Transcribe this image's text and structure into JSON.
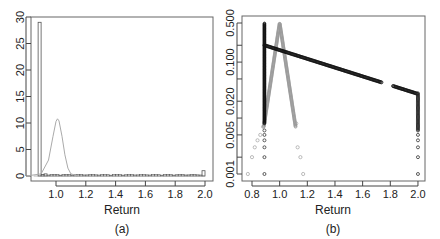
{
  "chart_data": [
    {
      "panel": "(a)",
      "type": "bar",
      "title": "",
      "xlabel": "Return",
      "ylabel": "",
      "caption": "(a)",
      "xlim": [
        0.83,
        2.05
      ],
      "ylim": [
        0,
        30
      ],
      "xticks": [
        "1.0",
        "1.2",
        "1.4",
        "1.6",
        "1.8",
        "2.0"
      ],
      "yticks": [
        "0",
        "5",
        "10",
        "15",
        "20",
        "25",
        "30"
      ],
      "grid": false,
      "legend": null,
      "histogram": {
        "bin_width": 0.02,
        "bins": [
          {
            "x0": 0.88,
            "x1": 0.9,
            "height": 29.0
          },
          {
            "x0": 0.9,
            "x1": 0.92,
            "height": 0.3
          },
          {
            "x0": 0.92,
            "x1": 0.94,
            "height": 0.4
          },
          {
            "x0": 0.94,
            "x1": 1.98,
            "height": 0.2
          },
          {
            "x0": 1.98,
            "x1": 2.0,
            "height": 1.0
          }
        ]
      },
      "density_curve": {
        "color": "#aaaaaa",
        "x": [
          0.8,
          0.9,
          0.95,
          0.98,
          1.0,
          1.01,
          1.02,
          1.04,
          1.06,
          1.08,
          1.1,
          1.15
        ],
        "y": [
          0.0,
          0.4,
          3.0,
          7.5,
          10.3,
          10.8,
          10.4,
          7.5,
          4.0,
          1.5,
          0.4,
          0.0
        ]
      }
    },
    {
      "panel": "(b)",
      "type": "scatter",
      "title": "",
      "xlabel": "Return",
      "ylabel": "",
      "caption": "(b)",
      "xlim": [
        0.75,
        2.03
      ],
      "ylim": [
        0.001,
        0.5
      ],
      "yscale": "log",
      "xticks": [
        "0.8",
        "1.0",
        "1.2",
        "1.4",
        "1.6",
        "1.8",
        "2.0"
      ],
      "yticks": [
        "0.001",
        "0.005",
        "0.020",
        "0.100",
        "0.500"
      ],
      "yticks_minor": [
        "0.002",
        "0.010",
        "0.050",
        "0.200"
      ],
      "grid": false,
      "legend": null,
      "series": [
        {
          "name": "gray-distribution",
          "color": "#999999",
          "marker": "open-circle",
          "description": "Triangular peak centered at 1.0 reaching 0.5, tails down to 0.001 at ~0.77 and ~1.17",
          "x": [
            0.77,
            0.8,
            0.82,
            0.84,
            0.86,
            0.88,
            0.9,
            0.93,
            0.96,
            0.98,
            1.0,
            1.02,
            1.04,
            1.07,
            1.1,
            1.12,
            1.13,
            1.15,
            1.17
          ],
          "y": [
            0.001,
            0.002,
            0.003,
            0.004,
            0.005,
            0.007,
            0.015,
            0.05,
            0.15,
            0.3,
            0.5,
            0.3,
            0.15,
            0.05,
            0.012,
            0.008,
            0.003,
            0.002,
            0.001
          ]
        },
        {
          "name": "black-distribution",
          "color": "#111111",
          "marker": "open-circle",
          "description": "Vertical stack at x=0.89 (0.001–0.5), declining line from 0.89 to 2.0, vertical stack at x=2.0 (0.001–0.03)",
          "x": [
            0.89,
            0.89,
            0.89,
            0.89,
            0.89,
            0.89,
            0.95,
            1.1,
            1.2,
            1.3,
            1.4,
            1.5,
            1.6,
            1.68,
            1.72,
            1.83,
            1.9,
            1.95,
            2.0,
            2.0,
            2.0,
            2.0,
            2.0,
            2.0
          ],
          "y": [
            0.001,
            0.002,
            0.003,
            0.005,
            0.2,
            0.5,
            0.19,
            0.16,
            0.13,
            0.11,
            0.09,
            0.075,
            0.062,
            0.052,
            0.048,
            0.04,
            0.035,
            0.03,
            0.025,
            0.01,
            0.005,
            0.003,
            0.002,
            0.001
          ]
        }
      ]
    }
  ],
  "panels": {
    "a": {
      "xlabel": "Return",
      "caption": "(a)"
    },
    "b": {
      "xlabel": "Return",
      "caption": "(b)"
    }
  }
}
